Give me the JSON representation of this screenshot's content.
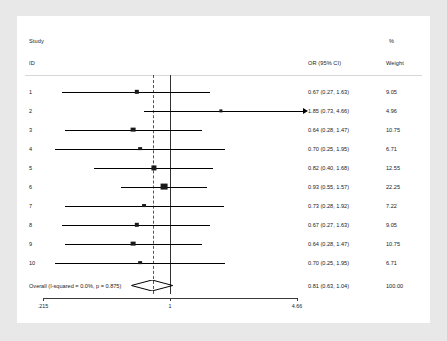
{
  "chart_data": {
    "type": "forest",
    "title": "",
    "columns": {
      "study_header_line1": "Study",
      "study_header_line2": "ID",
      "effect_header": "OR (95% CI)",
      "weight_header_line1": "%",
      "weight_header_line2": "Weight"
    },
    "effect_measure": "OR",
    "null_value": 1,
    "scale": "log",
    "xlim": [
      0.215,
      4.66
    ],
    "xticks": [
      0.215,
      1,
      4.66
    ],
    "xticklabels": [
      ".215",
      "1",
      "4.66"
    ],
    "pooled_reference_line": 0.81,
    "studies": [
      {
        "id": "1",
        "or": 0.67,
        "lcl": 0.27,
        "ucl": 1.63,
        "label": "0.67 (0.27, 1.63)",
        "weight": 9.05,
        "weight_label": "9.05",
        "truncated_right": false
      },
      {
        "id": "2",
        "or": 1.85,
        "lcl": 0.73,
        "ucl": 4.66,
        "label": "1.85 (0.73, 4.66)",
        "weight": 4.96,
        "weight_label": "4.96",
        "truncated_right": true
      },
      {
        "id": "3",
        "or": 0.64,
        "lcl": 0.28,
        "ucl": 1.47,
        "label": "0.64 (0.28, 1.47)",
        "weight": 10.75,
        "weight_label": "10.75",
        "truncated_right": false
      },
      {
        "id": "4",
        "or": 0.7,
        "lcl": 0.25,
        "ucl": 1.95,
        "label": "0.70 (0.25, 1.95)",
        "weight": 6.71,
        "weight_label": "6.71",
        "truncated_right": false
      },
      {
        "id": "5",
        "or": 0.82,
        "lcl": 0.4,
        "ucl": 1.68,
        "label": "0.82 (0.40, 1.68)",
        "weight": 12.55,
        "weight_label": "12.55",
        "truncated_right": false
      },
      {
        "id": "6",
        "or": 0.93,
        "lcl": 0.55,
        "ucl": 1.57,
        "label": "0.93 (0.55, 1.57)",
        "weight": 22.25,
        "weight_label": "22.25",
        "truncated_right": false
      },
      {
        "id": "7",
        "or": 0.73,
        "lcl": 0.28,
        "ucl": 1.92,
        "label": "0.73 (0.28, 1.92)",
        "weight": 7.22,
        "weight_label": "7.22",
        "truncated_right": false
      },
      {
        "id": "8",
        "or": 0.67,
        "lcl": 0.27,
        "ucl": 1.63,
        "label": "0.67 (0.27, 1.63)",
        "weight": 9.05,
        "weight_label": "9.05",
        "truncated_right": false
      },
      {
        "id": "9",
        "or": 0.64,
        "lcl": 0.28,
        "ucl": 1.47,
        "label": "0.64 (0.28, 1.47)",
        "weight": 10.75,
        "weight_label": "10.75",
        "truncated_right": false
      },
      {
        "id": "10",
        "or": 0.7,
        "lcl": 0.25,
        "ucl": 1.95,
        "label": "0.70 (0.25, 1.95)",
        "weight": 6.71,
        "weight_label": "6.71",
        "truncated_right": false
      }
    ],
    "overall": {
      "id": "Overall  (I-squared = 0.0%, p = 0.875)",
      "or": 0.81,
      "lcl": 0.63,
      "ucl": 1.04,
      "label": "0.81 (0.63, 1.04)",
      "weight_label": "100.00",
      "i_squared": "0.0%",
      "p_value": "0.875"
    }
  },
  "colors": {
    "page_background": "#e8e8e8",
    "panel_background": "#ffffff",
    "text": "#1b1b1b",
    "marker": "#1a1a1a",
    "null_line": "#333333",
    "reference_line": "#555555",
    "axis": "#3a3a3a",
    "rule": "#d8d8d8"
  }
}
